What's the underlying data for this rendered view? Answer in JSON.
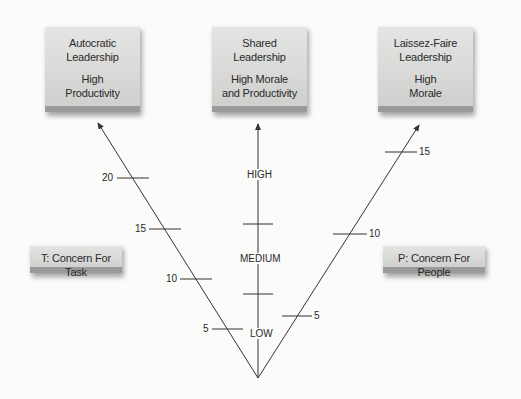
{
  "boxes": {
    "autocratic": {
      "line1": "Autocratic",
      "line2": "Leadership",
      "line3": "High",
      "line4": "Productivity"
    },
    "shared": {
      "line1": "Shared",
      "line2": "Leadership",
      "line3": "High Morale",
      "line4": "and Productivity"
    },
    "laissez_faire": {
      "line1": "Laissez-Faire",
      "line2": "Leadership",
      "line3": "High",
      "line4": "Morale"
    },
    "task": {
      "label": "T: Concern For Task"
    },
    "people": {
      "label": "P: Concern For People"
    }
  },
  "task_axis": {
    "ticks": [
      "20",
      "15",
      "10",
      "5"
    ]
  },
  "people_axis": {
    "ticks": [
      "15",
      "10",
      "5"
    ]
  },
  "center_axis": {
    "levels": [
      "HIGH",
      "MEDIUM",
      "LOW"
    ]
  },
  "colors": {
    "box": "#dcdcdb",
    "line": "#333333",
    "background": "#fbfbfa"
  }
}
